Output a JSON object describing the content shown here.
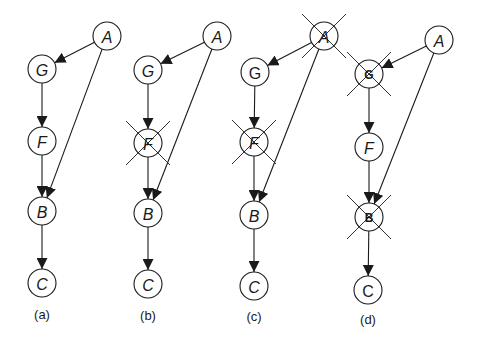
{
  "diagram": {
    "node_radius": 14,
    "colors": {
      "stroke": "#1a1a1a",
      "fill": "#ffffff",
      "background": "#ffffff"
    },
    "panels": [
      {
        "id": "a",
        "label": "(a)",
        "label_pos": [
          42,
          314
        ],
        "nodes": [
          {
            "id": "A",
            "label": "A",
            "x": 107,
            "y": 36,
            "crossed": false,
            "style": "italic"
          },
          {
            "id": "G",
            "label": "G",
            "x": 42,
            "y": 69,
            "crossed": false,
            "style": "italic"
          },
          {
            "id": "F",
            "label": "F",
            "x": 42,
            "y": 141,
            "crossed": false,
            "style": "italic"
          },
          {
            "id": "B",
            "label": "B",
            "x": 42,
            "y": 211,
            "crossed": false,
            "style": "italic"
          },
          {
            "id": "C",
            "label": "C",
            "x": 42,
            "y": 283,
            "crossed": false,
            "style": "italic"
          }
        ],
        "edges": [
          [
            "A",
            "G"
          ],
          [
            "G",
            "F"
          ],
          [
            "F",
            "B"
          ],
          [
            "A",
            "B"
          ],
          [
            "B",
            "C"
          ]
        ]
      },
      {
        "id": "b",
        "label": "(b)",
        "label_pos": [
          148,
          315
        ],
        "nodes": [
          {
            "id": "A",
            "label": "A",
            "x": 217,
            "y": 36,
            "crossed": false,
            "style": "italic"
          },
          {
            "id": "G",
            "label": "G",
            "x": 148,
            "y": 70,
            "crossed": false,
            "style": "italic"
          },
          {
            "id": "F",
            "label": "F",
            "x": 148,
            "y": 143,
            "crossed": true,
            "style": "italic"
          },
          {
            "id": "B",
            "label": "B",
            "x": 148,
            "y": 213,
            "crossed": false,
            "style": "italic"
          },
          {
            "id": "C",
            "label": "C",
            "x": 148,
            "y": 284,
            "crossed": false,
            "style": "italic"
          }
        ],
        "edges": [
          [
            "A",
            "G"
          ],
          [
            "G",
            "F"
          ],
          [
            "F",
            "B"
          ],
          [
            "A",
            "B"
          ],
          [
            "B",
            "C"
          ]
        ]
      },
      {
        "id": "c",
        "label": "(c)",
        "label_pos": [
          254,
          316
        ],
        "nodes": [
          {
            "id": "A",
            "label": "A",
            "x": 324,
            "y": 36,
            "crossed": true,
            "style": "italic"
          },
          {
            "id": "G",
            "label": "G",
            "x": 255,
            "y": 72,
            "crossed": false,
            "style": "upright"
          },
          {
            "id": "F",
            "label": "F",
            "x": 254,
            "y": 142,
            "crossed": true,
            "style": "italic"
          },
          {
            "id": "B",
            "label": "B",
            "x": 254,
            "y": 215,
            "crossed": false,
            "style": "italic"
          },
          {
            "id": "C",
            "label": "C",
            "x": 254,
            "y": 286,
            "crossed": false,
            "style": "italic"
          }
        ],
        "edges": [
          [
            "A",
            "G"
          ],
          [
            "G",
            "F"
          ],
          [
            "F",
            "B"
          ],
          [
            "A",
            "B"
          ],
          [
            "B",
            "C"
          ]
        ]
      },
      {
        "id": "d",
        "label": "(d)",
        "label_pos": [
          368,
          319
        ],
        "nodes": [
          {
            "id": "A",
            "label": "A",
            "x": 439,
            "y": 40,
            "crossed": false,
            "style": "italic"
          },
          {
            "id": "G",
            "label": "G",
            "x": 369,
            "y": 74,
            "crossed": true,
            "style": "small"
          },
          {
            "id": "F",
            "label": "F",
            "x": 369,
            "y": 147,
            "crossed": false,
            "style": "italic"
          },
          {
            "id": "B",
            "label": "B",
            "x": 369,
            "y": 217,
            "crossed": true,
            "style": "small"
          },
          {
            "id": "C",
            "label": "C",
            "x": 368,
            "y": 290,
            "crossed": false,
            "style": "upright"
          }
        ],
        "edges": [
          [
            "A",
            "G"
          ],
          [
            "G",
            "F"
          ],
          [
            "F",
            "B"
          ],
          [
            "A",
            "B"
          ],
          [
            "B",
            "C"
          ]
        ]
      }
    ]
  }
}
